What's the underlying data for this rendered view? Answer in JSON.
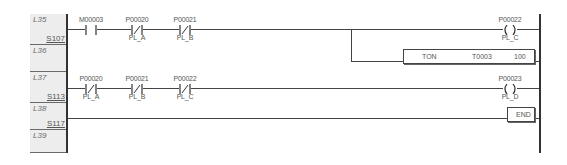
{
  "gutter": {
    "lines": [
      "L35",
      "L36",
      "L37",
      "L38",
      "L39"
    ],
    "steps": [
      "S107",
      "S113",
      "S117"
    ]
  },
  "rungs": [
    {
      "contacts": [
        {
          "address": "M00003",
          "comment": "",
          "type": "NO"
        },
        {
          "address": "P00020",
          "comment": "PL_A",
          "type": "NC"
        },
        {
          "address": "P00021",
          "comment": "PL_B",
          "type": "NC"
        }
      ],
      "coil": {
        "address": "P00022",
        "comment": "PL_C"
      },
      "function_block": {
        "name": "TON",
        "operand": "T0003",
        "preset": "100"
      }
    },
    {
      "contacts": [
        {
          "address": "P00020",
          "comment": "PL_A",
          "type": "NC"
        },
        {
          "address": "P00021",
          "comment": "PL_B",
          "type": "NC"
        },
        {
          "address": "P00022",
          "comment": "PL_C",
          "type": "NC"
        }
      ],
      "coil": {
        "address": "P00023",
        "comment": "PL_D"
      }
    },
    {
      "end_block": {
        "name": "END"
      }
    }
  ],
  "colors": {
    "wire": "#444444",
    "gutter_bg": "#ededed",
    "label": "#555555"
  }
}
